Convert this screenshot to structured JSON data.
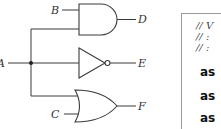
{
  "diagram": {
    "type": "logic-circuit",
    "inputs": {
      "a": "A",
      "b": "B",
      "c": "C"
    },
    "outputs": {
      "d": "D",
      "e": "E",
      "f": "F"
    },
    "gates": [
      {
        "type": "AND",
        "inputs": [
          "B",
          "A"
        ],
        "output": "D"
      },
      {
        "type": "NOT",
        "inputs": [
          "A"
        ],
        "output": "E"
      },
      {
        "type": "OR",
        "inputs": [
          "A",
          "C"
        ],
        "output": "F"
      }
    ]
  },
  "code": {
    "comments": [
      "// V",
      "// :",
      "// :"
    ],
    "lines": [
      "as",
      "as",
      "as"
    ]
  }
}
